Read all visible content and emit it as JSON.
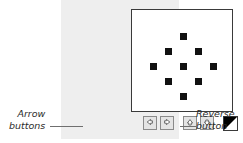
{
  "panel": {
    "background_color": "#eeeeee"
  },
  "canvas": {
    "background_color": "#ffffff",
    "border_color": "#3a3a3a",
    "dot_color": "#111111",
    "pattern_name": "diamond-dot-pattern",
    "dot_count": 9,
    "dots": [
      {
        "name": "dot-top",
        "x": 48,
        "y": 23
      },
      {
        "name": "dot-upper-left",
        "x": 33,
        "y": 38
      },
      {
        "name": "dot-upper-right",
        "x": 63,
        "y": 38
      },
      {
        "name": "dot-left",
        "x": 18,
        "y": 53
      },
      {
        "name": "dot-center",
        "x": 48,
        "y": 53
      },
      {
        "name": "dot-right",
        "x": 78,
        "y": 53
      },
      {
        "name": "dot-lower-left",
        "x": 33,
        "y": 68
      },
      {
        "name": "dot-lower-right",
        "x": 63,
        "y": 68
      },
      {
        "name": "dot-bottom",
        "x": 48,
        "y": 83
      }
    ]
  },
  "toolbar": {
    "buttons": [
      {
        "name": "arrow-left-button",
        "icon": "arrow-left-icon",
        "label": "Left"
      },
      {
        "name": "arrow-right-button",
        "icon": "arrow-right-icon",
        "label": "Right"
      },
      {
        "name": "arrow-up-button",
        "icon": "arrow-up-icon",
        "label": "Up"
      },
      {
        "name": "arrow-down-button",
        "icon": "arrow-down-icon",
        "label": "Down"
      }
    ],
    "reverse_button": {
      "name": "reverse-button",
      "icon": "reverse-diagonal-icon",
      "label": "Reverse"
    }
  },
  "annotations": {
    "arrow_buttons": {
      "line1": "Arrow",
      "line2": "buttons"
    },
    "reverse_button": {
      "line1": "Reverse",
      "line2": "button"
    }
  }
}
